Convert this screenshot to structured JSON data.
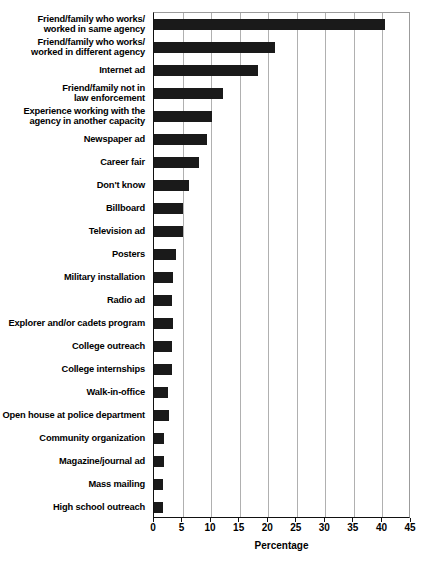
{
  "chart_data": {
    "type": "bar",
    "orientation": "horizontal",
    "title": "",
    "xlabel": "Percentage",
    "ylabel": "",
    "xlim": [
      0,
      45
    ],
    "xticks": [
      0,
      5,
      10,
      15,
      20,
      25,
      30,
      35,
      40,
      45
    ],
    "grid": "vertical",
    "legend": null,
    "bar_color": "#1a1a1a",
    "categories": [
      "Friend/family who works/\nworked in same agency",
      "Friend/family who works/\nworked in different agency",
      "Internet ad",
      "Friend/family not in\nlaw enforcement",
      "Experience working with the\nagency in another capacity",
      "Newspaper ad",
      "Career fair",
      "Don't know",
      "Billboard",
      "Television ad",
      "Posters",
      "Military installation",
      "Radio ad",
      "Explorer and/or cadets program",
      "College outreach",
      "College internships",
      "Walk-in-office",
      "Open house at police department",
      "Community organization",
      "Magazine/journal ad",
      "Mass mailing",
      "High school outreach"
    ],
    "values": [
      40.5,
      21.1,
      18.2,
      12.1,
      10.2,
      9.2,
      7.9,
      6.1,
      5.1,
      5.0,
      3.9,
      3.3,
      3.1,
      3.3,
      3.1,
      3.2,
      2.5,
      2.6,
      1.7,
      1.8,
      1.6,
      1.6
    ]
  }
}
